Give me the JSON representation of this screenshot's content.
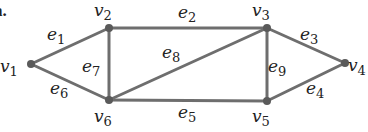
{
  "figure_label": "a.",
  "colors": {
    "edge": "#6e6e6e",
    "node": "#5a5a5a",
    "text": "#222222"
  },
  "nodes": [
    {
      "id": "v1",
      "letter": "v",
      "sub": "1",
      "x": 31,
      "y": 64,
      "lx": 0,
      "ly": 72
    },
    {
      "id": "v2",
      "letter": "v",
      "sub": "2",
      "x": 109,
      "y": 28,
      "lx": 94,
      "ly": 16
    },
    {
      "id": "v3",
      "letter": "v",
      "sub": "3",
      "x": 267,
      "y": 28,
      "lx": 252,
      "ly": 16
    },
    {
      "id": "v4",
      "letter": "v",
      "sub": "4",
      "x": 345,
      "y": 63,
      "lx": 348,
      "ly": 71
    },
    {
      "id": "v5",
      "letter": "v",
      "sub": "5",
      "x": 267,
      "y": 101,
      "lx": 252,
      "ly": 122
    },
    {
      "id": "v6",
      "letter": "v",
      "sub": "6",
      "x": 109,
      "y": 100,
      "lx": 94,
      "ly": 122
    }
  ],
  "edges": [
    {
      "id": "e1",
      "from": "v1",
      "to": "v2",
      "letter": "e",
      "sub": "1",
      "lx": 47,
      "ly": 40
    },
    {
      "id": "e2",
      "from": "v2",
      "to": "v3",
      "letter": "e",
      "sub": "2",
      "lx": 178,
      "ly": 18
    },
    {
      "id": "e3",
      "from": "v3",
      "to": "v4",
      "letter": "e",
      "sub": "3",
      "lx": 300,
      "ly": 40
    },
    {
      "id": "e4",
      "from": "v5",
      "to": "v4",
      "letter": "e",
      "sub": "4",
      "lx": 306,
      "ly": 94
    },
    {
      "id": "e5",
      "from": "v6",
      "to": "v5",
      "letter": "e",
      "sub": "5",
      "lx": 178,
      "ly": 118
    },
    {
      "id": "e6",
      "from": "v1",
      "to": "v6",
      "letter": "e",
      "sub": "6",
      "lx": 50,
      "ly": 94
    },
    {
      "id": "e7",
      "from": "v2",
      "to": "v6",
      "letter": "e",
      "sub": "7",
      "lx": 82,
      "ly": 72
    },
    {
      "id": "e8",
      "from": "v6",
      "to": "v3",
      "letter": "e",
      "sub": "8",
      "lx": 162,
      "ly": 58
    },
    {
      "id": "e9",
      "from": "v3",
      "to": "v5",
      "letter": "e",
      "sub": "9",
      "lx": 268,
      "ly": 72
    }
  ]
}
